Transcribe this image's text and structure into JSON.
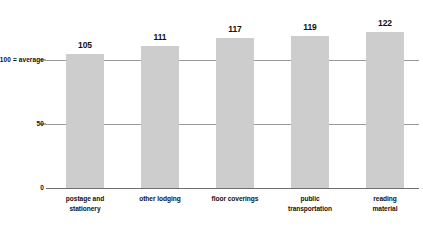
{
  "chart_data": {
    "type": "bar",
    "title": "",
    "subtitle": "",
    "xlabel": "",
    "ylabel": "",
    "categories": [
      "postage and stationery",
      "other lodging",
      "floor coverings",
      "public transportation",
      "reading material"
    ],
    "values": [
      105,
      111,
      117,
      119,
      122
    ],
    "value_labels": [
      "105",
      "111",
      "117",
      "119",
      "122"
    ],
    "ylim": [
      0,
      130
    ],
    "yticks": [
      0,
      50,
      100
    ],
    "ytick_labels": [
      "0",
      "50",
      "100 = average"
    ],
    "grid": true,
    "legend": "none",
    "bar_color": "#cdcdcd",
    "gridline_color": "#9a9a9a",
    "axis_color": "#6f6f6f",
    "text_color": "#111111",
    "background": "#ffffff"
  },
  "axis": {
    "tick_100_label": "100 = average",
    "tick_50_label": "50",
    "tick_0_label": "0"
  },
  "bars": [
    {
      "value_label": "105",
      "label_line1": "postage and",
      "label_line2": "stationery"
    },
    {
      "value_label": "111",
      "label_line1": "other lodging",
      "label_line2": ""
    },
    {
      "value_label": "117",
      "label_line1": "floor coverings",
      "label_line2": ""
    },
    {
      "value_label": "119",
      "label_line1": "public",
      "label_line2": "transportation"
    },
    {
      "value_label": "122",
      "label_line1": "reading",
      "label_line2": "material"
    }
  ]
}
